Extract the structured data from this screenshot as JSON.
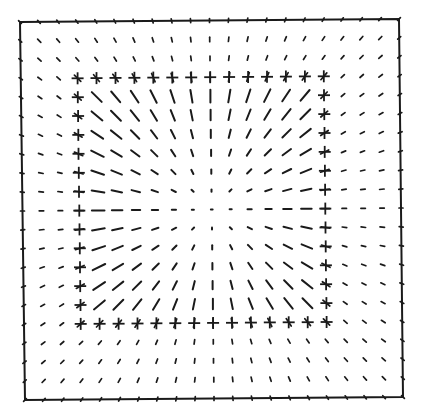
{
  "diagram": {
    "type": "vector-field",
    "frame": {
      "corners": {
        "tl": [
          20,
          22
        ],
        "tr": [
          399,
          19
        ],
        "br": [
          403,
          397
        ],
        "bl": [
          25,
          400
        ]
      },
      "stroke_color": "#1a1a1a"
    },
    "grid": {
      "n": 21,
      "center": [
        10,
        10
      ]
    },
    "boundary_box": {
      "min": 3,
      "max": 16,
      "marker": "+",
      "marker_size": 12
    },
    "segments": {
      "inside_scale_px_per_unit": 2.1,
      "inside_max_px": 14,
      "boundary_segment_px": 9,
      "outside_px": 4.5,
      "edge_px": 4,
      "color": "#1a1a1a"
    }
  }
}
